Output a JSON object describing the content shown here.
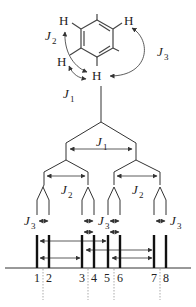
{
  "diagram": {
    "molecule": {
      "atom_label": "H",
      "hydrogens": [
        {
          "id": "h-top-left",
          "x": 63,
          "y": 21
        },
        {
          "id": "h-top-right",
          "x": 130,
          "y": 21
        },
        {
          "id": "h-mid-left",
          "x": 61,
          "y": 62
        },
        {
          "id": "h-center",
          "x": 96,
          "y": 78
        }
      ],
      "coupling_labels": {
        "j1": {
          "symbol": "J",
          "sub": "1"
        },
        "j2": {
          "symbol": "J",
          "sub": "2"
        },
        "j3": {
          "symbol": "J",
          "sub": "3"
        }
      }
    },
    "splitting_tree": {
      "level1_label": {
        "symbol": "J",
        "sub": "1"
      },
      "level2_labels": [
        {
          "symbol": "J",
          "sub": "2"
        },
        {
          "symbol": "J",
          "sub": "2"
        }
      ],
      "level3_labels": [
        {
          "symbol": "J",
          "sub": "3"
        },
        {
          "symbol": "J",
          "sub": "3"
        },
        {
          "symbol": "J",
          "sub": "3"
        },
        {
          "symbol": "J",
          "sub": "3"
        }
      ]
    },
    "spectrum": {
      "peak_labels": [
        "1",
        "2",
        "3",
        "4",
        "5",
        "6",
        "7",
        "8"
      ],
      "peak_positions_px": [
        37,
        49,
        82,
        94,
        108,
        120,
        154,
        166
      ]
    }
  }
}
